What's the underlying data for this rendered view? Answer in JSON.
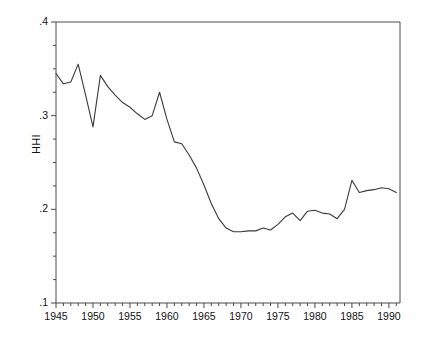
{
  "chart_data": {
    "type": "line",
    "title": "",
    "subtitle": "",
    "xlabel": "",
    "ylabel": "HHI",
    "xlim": [
      1945,
      1991.5
    ],
    "ylim": [
      0.1,
      0.4
    ],
    "grid": false,
    "legend": "none",
    "line_color": "#3a3a3a",
    "frame_color": "#4a4a4a",
    "x_tick_labels": [
      "1945",
      "1950",
      "1955",
      "1960",
      "1965",
      "1970",
      "1975",
      "1980",
      "1985",
      "1990"
    ],
    "x_tick_values": [
      1945,
      1950,
      1955,
      1960,
      1965,
      1970,
      1975,
      1980,
      1985,
      1990
    ],
    "x_minor_ticks": [
      1946,
      1947,
      1948,
      1949,
      1951,
      1952,
      1953,
      1954,
      1956,
      1957,
      1958,
      1959,
      1961,
      1962,
      1963,
      1964,
      1966,
      1967,
      1968,
      1969,
      1971,
      1972,
      1973,
      1974,
      1976,
      1977,
      1978,
      1979,
      1981,
      1982,
      1983,
      1984,
      1986,
      1987,
      1988,
      1989,
      1991
    ],
    "y_tick_labels": [
      ".1",
      ".2",
      ".3",
      ".4"
    ],
    "y_tick_values": [
      0.1,
      0.2,
      0.3,
      0.4
    ],
    "y_minor_ticks": [
      0.125,
      0.15,
      0.175,
      0.225,
      0.25,
      0.275,
      0.325,
      0.35,
      0.375
    ],
    "series": [
      {
        "name": "HHI",
        "x": [
          1945,
          1946,
          1947,
          1948,
          1949,
          1950,
          1951,
          1952,
          1953,
          1954,
          1955,
          1956,
          1957,
          1958,
          1959,
          1960,
          1961,
          1962,
          1963,
          1964,
          1965,
          1966,
          1967,
          1968,
          1969,
          1970,
          1971,
          1972,
          1973,
          1974,
          1975,
          1976,
          1977,
          1978,
          1979,
          1980,
          1981,
          1982,
          1983,
          1984,
          1985,
          1986,
          1987,
          1988,
          1989,
          1990,
          1991
        ],
        "values": [
          0.345,
          0.334,
          0.336,
          0.355,
          0.322,
          0.288,
          0.343,
          0.331,
          0.322,
          0.314,
          0.309,
          0.302,
          0.296,
          0.3,
          0.325,
          0.296,
          0.272,
          0.27,
          0.258,
          0.244,
          0.226,
          0.206,
          0.19,
          0.18,
          0.176,
          0.176,
          0.177,
          0.177,
          0.18,
          0.178,
          0.184,
          0.192,
          0.196,
          0.188,
          0.198,
          0.199,
          0.196,
          0.195,
          0.19,
          0.2,
          0.231,
          0.218,
          0.22,
          0.221,
          0.223,
          0.222,
          0.218
        ]
      }
    ]
  }
}
